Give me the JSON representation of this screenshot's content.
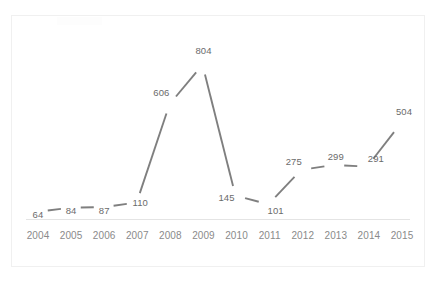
{
  "chart_data": {
    "type": "line",
    "title": "",
    "subtitle": "",
    "xlabel": "",
    "ylabel": "",
    "categories": [
      "2004",
      "2005",
      "2006",
      "2007",
      "2008",
      "2009",
      "2010",
      "2011",
      "2012",
      "2013",
      "2014",
      "2015"
    ],
    "values": [
      64,
      84,
      87,
      110,
      606,
      804,
      145,
      101,
      275,
      299,
      291,
      504
    ],
    "series": [
      {
        "name": "",
        "values": [
          64,
          84,
          87,
          110,
          606,
          804,
          145,
          101,
          275,
          299,
          291,
          504
        ]
      }
    ],
    "data_labels": [
      "64",
      "84",
      "87",
      "110",
      "606",
      "804",
      "145",
      "101",
      "275",
      "299",
      "291",
      "504"
    ],
    "ylim": [
      0,
      880
    ],
    "grid": false,
    "legend": false,
    "legend_position": "none",
    "annotations": [],
    "line_color": "#7f7f7f",
    "label_color": "#6b6b6b",
    "tick_color": "#8a8a8a",
    "axis_color": "#e4e4e4",
    "background_color": "#ffffff",
    "border_color": "#f0f0f0"
  },
  "axis": {
    "x_tick_labels": [
      "2004",
      "2005",
      "2006",
      "2007",
      "2008",
      "2009",
      "2010",
      "2011",
      "2012",
      "2013",
      "2014",
      "2015"
    ]
  }
}
